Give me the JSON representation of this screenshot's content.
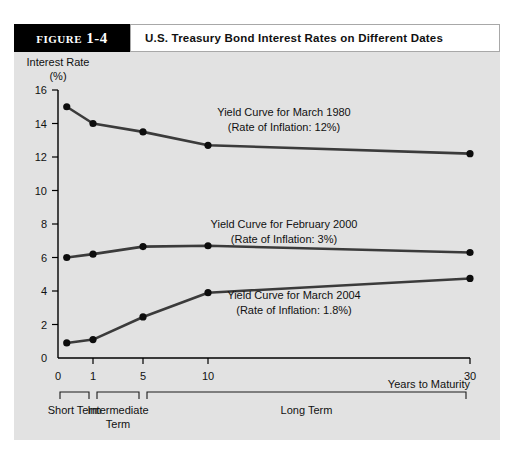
{
  "figure": {
    "label": "Figure 1-4",
    "title": "U.S. Treasury Bond Interest Rates on Different Dates"
  },
  "chart_data": {
    "type": "line",
    "title": "U.S. Treasury Bond Interest Rates on Different Dates",
    "ylabel_line1": "Interest Rate",
    "ylabel_line2": "(%)",
    "xlabel": "Years to Maturity",
    "ylim": [
      0,
      16
    ],
    "yticks": [
      0,
      2,
      4,
      6,
      8,
      10,
      12,
      14,
      16
    ],
    "ytick_labels": [
      "0",
      "2",
      "4",
      "6",
      "8",
      "10",
      "12",
      "14",
      "16"
    ],
    "xticks": [
      0,
      1,
      5,
      10,
      30
    ],
    "xtick_labels": [
      "0",
      "1",
      "5",
      "10",
      "30"
    ],
    "x_scale": "nonlinear-compressed",
    "grid": false,
    "legend": "inline-annotations",
    "series": [
      {
        "name": "Yield Curve for March 1980",
        "annotation_line1": "Yield Curve for March 1980",
        "annotation_line2": "(Rate of Inflation: 12%)",
        "x": [
          0.25,
          1,
          5,
          10,
          30
        ],
        "values": [
          15.0,
          14.0,
          13.5,
          12.7,
          12.2
        ]
      },
      {
        "name": "Yield Curve for February 2000",
        "annotation_line1": "Yield Curve for February 2000",
        "annotation_line2": "(Rate of Inflation: 3%)",
        "x": [
          0.25,
          1,
          5,
          10,
          30
        ],
        "values": [
          6.0,
          6.2,
          6.65,
          6.7,
          6.3
        ]
      },
      {
        "name": "Yield Curve for March 2004",
        "annotation_line1": "Yield Curve for March 2004",
        "annotation_line2": "(Rate of Inflation: 1.8%)",
        "x": [
          0.25,
          1,
          5,
          10,
          30
        ],
        "values": [
          0.9,
          1.1,
          2.45,
          3.9,
          4.75
        ]
      }
    ],
    "maturity_brackets": [
      {
        "label_line1": "Short Term",
        "label_line2": "",
        "from": 0,
        "to": 1
      },
      {
        "label_line1": "Intermediate",
        "label_line2": "Term",
        "from": 1,
        "to": 5
      },
      {
        "label_line1": "Long Term",
        "label_line2": "",
        "from": 5,
        "to": 30
      }
    ]
  },
  "colors": {
    "panel_background": "#e2e2e2",
    "line": "#3b3b3b",
    "marker": "#0d0d0d",
    "label_block": "#000000",
    "text": "#111111"
  }
}
